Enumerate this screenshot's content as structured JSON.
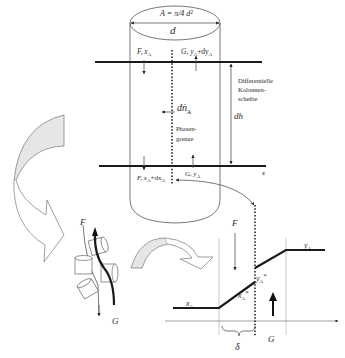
{
  "diagram": {
    "column": {
      "area_label": "A = π/4 d²",
      "diameter_label": "d",
      "top_left_label": "F, x",
      "top_left_sub": "A",
      "top_right_label": "G, y",
      "top_right_sub": "A",
      "top_right_suffix": "+dy",
      "top_right_suffix_sub": "A",
      "bottom_left_label": "F, x",
      "bottom_left_sub": "A",
      "bottom_left_suffix": "+dx",
      "bottom_left_suffix_sub": "A",
      "bottom_right_label": "G, y",
      "bottom_right_sub": "A",
      "flux_label": "dṅ",
      "flux_sub": "A",
      "interface_line1": "Phasen-",
      "interface_line2": "grenze",
      "slice_line1": "Differentielle",
      "slice_line2": "Kolonnen-",
      "slice_line3": "scheibe",
      "height_label": "dh",
      "axis_label": "z"
    },
    "packing": {
      "liquid_label": "F",
      "gas_label": "G"
    },
    "profile": {
      "liquid_label": "F",
      "gas_label": "G",
      "liquid_bulk": "x",
      "liquid_bulk_sub": "A",
      "liquid_interface": "x",
      "liquid_interface_sub": "A",
      "liquid_interface_sup": "*",
      "gas_bulk": "y",
      "gas_bulk_sub": "A",
      "gas_interface": "y",
      "gas_interface_sub": "A",
      "gas_interface_sup": "*",
      "film_thickness": "δ"
    }
  }
}
